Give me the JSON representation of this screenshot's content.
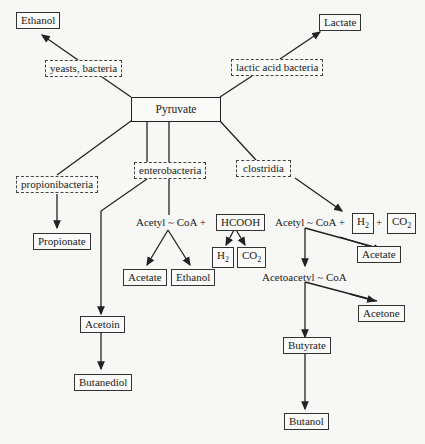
{
  "diagram": {
    "center": "Pyruvate",
    "organisms": {
      "yeasts": "yeasts, bacteria",
      "lactic": "lactic acid bacteria",
      "propioni": "propionibacteria",
      "entero": "enterobacteria",
      "clostridia": "clostridia"
    },
    "products": {
      "ethanol_top": "Ethanol",
      "lactate": "Lactate",
      "propionate": "Propionate",
      "acetoin": "Acetoin",
      "butanediol": "Butanediol",
      "acetate_entero": "Acetate",
      "ethanol_entero": "Ethanol",
      "acetate_clos": "Acetate",
      "acetone": "Acetone",
      "butyrate": "Butyrate",
      "butanol": "Butanol"
    },
    "intermediates": {
      "acetyl_coa_entero": "Acetyl ~ CoA +",
      "hcooh": "HCOOH",
      "h2_entero": "H",
      "co2_entero": "CO",
      "acetyl_coa_clos": "Acetyl ~ CoA +",
      "h2_clos": "H",
      "plus": "+",
      "co2_clos": "CO",
      "acetoacetyl_coa": "Acetoacetyl ~ CoA",
      "sub2": "2"
    }
  }
}
